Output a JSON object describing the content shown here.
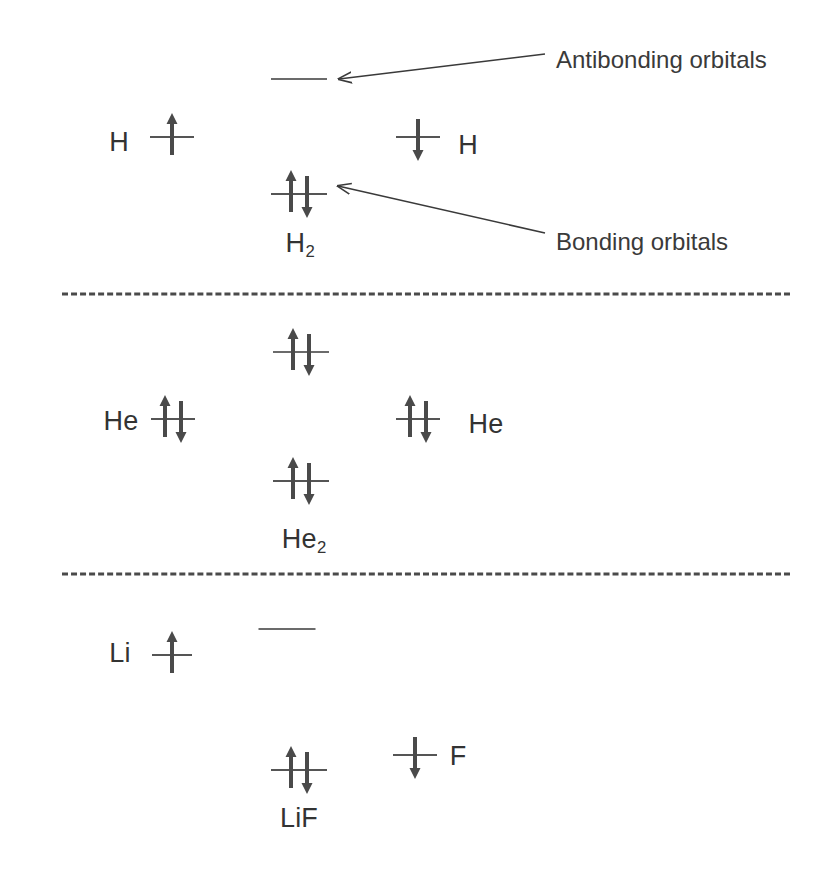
{
  "figure": {
    "type": "molecular-orbital-diagram",
    "title": "",
    "background_color": "#ffffff",
    "line_color": "#6b6b6b",
    "arrow_color": "#4a4a4a",
    "text_color": "#333333"
  },
  "annotations": [
    {
      "id": "antibonding",
      "text": "Antibonding orbitals",
      "text_x": 556,
      "text_y": 60,
      "arrow_from_x": 545,
      "arrow_from_y": 54,
      "arrow_to_x": 339,
      "arrow_to_y": 79
    },
    {
      "id": "bonding",
      "text": "Bonding orbitals",
      "text_x": 556,
      "text_y": 242,
      "arrow_from_x": 545,
      "arrow_from_y": 233,
      "arrow_to_x": 338,
      "arrow_to_y": 186
    }
  ],
  "dividers": [
    {
      "id": "divider-1",
      "x": 62,
      "y": 294,
      "width": 728
    },
    {
      "id": "divider-2",
      "x": 62,
      "y": 574,
      "width": 728
    }
  ],
  "sections": [
    {
      "id": "h2",
      "molecule_label": "H₂",
      "molecule_label_text": "H2",
      "molecule_label_x": 300,
      "molecule_label_y": 243,
      "levels": [
        {
          "id": "h2-antibonding",
          "role": "antibonding",
          "x": 299,
          "y": 79,
          "width": 56,
          "electrons": []
        },
        {
          "id": "h-left",
          "role": "atomic",
          "x": 172,
          "y": 137,
          "width": 44,
          "electrons": [
            "up"
          ]
        },
        {
          "id": "h-right",
          "role": "atomic",
          "x": 418,
          "y": 137,
          "width": 44,
          "electrons": [
            "down"
          ]
        },
        {
          "id": "h2-bonding",
          "role": "bonding",
          "x": 299,
          "y": 194,
          "width": 56,
          "electrons": [
            "up",
            "down"
          ]
        }
      ],
      "atom_labels": [
        {
          "id": "h-left-label",
          "text": "H",
          "x": 119,
          "y": 142
        },
        {
          "id": "h-right-label",
          "text": "H",
          "x": 468,
          "y": 145
        }
      ]
    },
    {
      "id": "he2",
      "molecule_label": "He₂",
      "molecule_label_text": "He2",
      "molecule_label_x": 304,
      "molecule_label_y": 539,
      "levels": [
        {
          "id": "he2-antibonding",
          "role": "antibonding",
          "x": 301,
          "y": 352,
          "width": 56,
          "electrons": [
            "up",
            "down"
          ]
        },
        {
          "id": "he-left",
          "role": "atomic",
          "x": 173,
          "y": 419,
          "width": 44,
          "electrons": [
            "up",
            "down"
          ]
        },
        {
          "id": "he-right",
          "role": "atomic",
          "x": 418,
          "y": 419,
          "width": 44,
          "electrons": [
            "up",
            "down"
          ]
        },
        {
          "id": "he2-bonding",
          "role": "bonding",
          "x": 301,
          "y": 481,
          "width": 56,
          "electrons": [
            "up",
            "down"
          ]
        }
      ],
      "atom_labels": [
        {
          "id": "he-left-label",
          "text": "He",
          "x": 121,
          "y": 421
        },
        {
          "id": "he-right-label",
          "text": "He",
          "x": 486,
          "y": 424
        }
      ]
    },
    {
      "id": "lif",
      "molecule_label": "LiF",
      "molecule_label_text": "LiF",
      "molecule_label_x": 299,
      "molecule_label_y": 818,
      "levels": [
        {
          "id": "lif-antibonding",
          "role": "antibonding",
          "x": 287,
          "y": 629,
          "width": 57,
          "electrons": []
        },
        {
          "id": "li-left",
          "role": "atomic",
          "x": 172,
          "y": 655,
          "width": 40,
          "electrons": [
            "up"
          ]
        },
        {
          "id": "f-right",
          "role": "atomic",
          "x": 415,
          "y": 755,
          "width": 44,
          "electrons": [
            "down"
          ]
        },
        {
          "id": "lif-bonding",
          "role": "bonding",
          "x": 299,
          "y": 770,
          "width": 56,
          "electrons": [
            "up",
            "down"
          ]
        }
      ],
      "atom_labels": [
        {
          "id": "li-left-label",
          "text": "Li",
          "x": 120,
          "y": 653
        },
        {
          "id": "f-right-label",
          "text": "F",
          "x": 458,
          "y": 756
        }
      ]
    }
  ]
}
